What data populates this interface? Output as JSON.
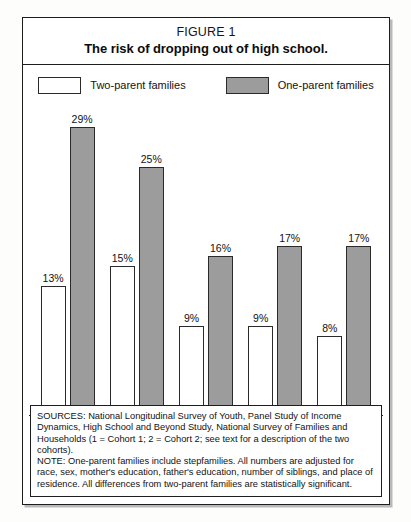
{
  "figure": {
    "number": "FIGURE 1",
    "title": "The risk of dropping out of high school."
  },
  "legend": {
    "items": [
      {
        "label": "Two-parent families",
        "swatch": "white-swatch",
        "color": "#ffffff"
      },
      {
        "label": "One-parent families",
        "swatch": "gray-swatch",
        "color": "#9c9c9c"
      }
    ]
  },
  "footnote": {
    "sources": "SOURCES: National Longitudinal Survey of Youth, Panel Study of Income Dynamics, High School and Beyond Study, National Survey of Families and Households (1 = Cohort 1; 2 = Cohort 2; see text for a description of the two cohorts).",
    "note": "NOTE: One-parent families include stepfamilies. All numbers are adjusted for race, sex, mother's education, father's education, number of siblings, and place of residence. All differences from two-parent families are statistically significant."
  },
  "chart_data": {
    "type": "bar",
    "title": "The risk of dropping out of high school.",
    "xlabel": "",
    "ylabel": "",
    "ylim": [
      0,
      30
    ],
    "grid": false,
    "legend_position": "top-center",
    "categories": [
      "NLSY",
      "PSID",
      "HSB",
      "NSFH1",
      "NSFH2"
    ],
    "series": [
      {
        "name": "Two-parent families",
        "color": "#ffffff",
        "values": [
          13,
          15,
          9,
          9,
          8
        ],
        "labels": [
          "13%",
          "15%",
          "9%",
          "9%",
          "8%"
        ]
      },
      {
        "name": "One-parent families",
        "color": "#9c9c9c",
        "values": [
          29,
          25,
          16,
          17,
          17
        ],
        "labels": [
          "29%",
          "25%",
          "16%",
          "17%",
          "17%"
        ]
      }
    ]
  }
}
